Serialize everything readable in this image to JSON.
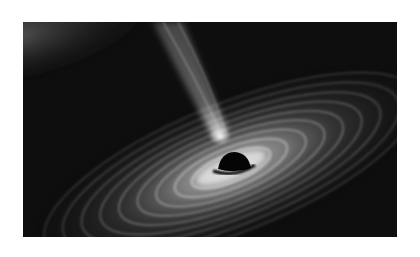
{
  "image": {
    "subject": "Black hole with accretion disk and relativistic jet (grayscale illustration)",
    "alt": "Grayscale illustration of a black hole surrounded by a swirling accretion disk, with a bright jet extending upward",
    "palette": {
      "background": "#ffffff",
      "space": "#0d0d0d",
      "disk_bright": "#f2f2f2",
      "disk_mid": "#8a8a8a",
      "event_horizon": "#050505"
    }
  }
}
